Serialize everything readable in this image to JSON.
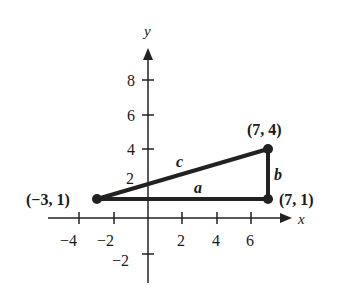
{
  "diagram": {
    "axes": {
      "x_label": "x",
      "y_label": "y"
    },
    "x_ticks": [
      "−4",
      "−2",
      "2",
      "4",
      "6"
    ],
    "y_ticks": [
      "8",
      "6",
      "4",
      "2",
      "−2"
    ],
    "points": [
      {
        "label": "(−3, 1)",
        "x": -3,
        "y": 1
      },
      {
        "label": "(7, 4)",
        "x": 7,
        "y": 4
      },
      {
        "label": "(7, 1)",
        "x": 7,
        "y": 1
      }
    ],
    "sides": {
      "a": "a",
      "b": "b",
      "c": "c"
    }
  }
}
